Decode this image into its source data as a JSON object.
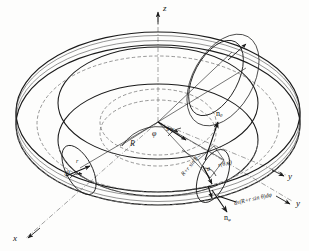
{
  "figure": {
    "background_color": "#fdfdfc",
    "line_color": "#1a1a1a",
    "dashed_color": "#555555"
  },
  "axes": [
    {
      "name": "z-axis",
      "label": "z",
      "x": 163,
      "y": 4,
      "kind": "axis"
    },
    {
      "name": "y-axis",
      "label": "y",
      "x": 296,
      "y": 204,
      "kind": "axis"
    },
    {
      "name": "x-axis",
      "label": "x",
      "x": 13,
      "y": 238,
      "kind": "axis"
    },
    {
      "name": "y-hat-axis",
      "label": "y",
      "x": 288,
      "y": 176,
      "kind": "unit-vector",
      "hat": true
    }
  ],
  "symbols": [
    {
      "name": "major-radius-R",
      "label": "R",
      "x": 130,
      "y": 140,
      "class": "sym-lbl"
    },
    {
      "name": "angle-phi",
      "label": "φ",
      "x": 152,
      "y": 132,
      "class": "sym-lbl"
    },
    {
      "name": "s-hat-vector",
      "label": "s",
      "x": 165,
      "y": 116,
      "class": "sym-lbl",
      "hat": true
    },
    {
      "name": "angle-phi-arc-2",
      "label": "φ",
      "x": 168,
      "y": 127,
      "class": "tiny-lbl"
    },
    {
      "name": "minor-radius-r",
      "label": "r",
      "x": 76,
      "y": 160,
      "class": "tiny-lbl"
    },
    {
      "name": "d-theta",
      "label": "dθ",
      "x": 66,
      "y": 172,
      "class": "tiny-lbl"
    },
    {
      "name": "angle-theta-right",
      "label": "θ",
      "x": 213,
      "y": 168,
      "class": "tiny-lbl"
    }
  ],
  "vectors": [
    {
      "name": "n-theta-upper",
      "base": "n",
      "sub": "θ",
      "x": 222,
      "y": 112
    },
    {
      "name": "n-phi-lower",
      "base": "n",
      "sub": "φ",
      "x": 229,
      "y": 216
    }
  ],
  "expressions": [
    {
      "name": "surface-element-label",
      "text": "ds(R+r sin θ)dφ",
      "x": 238,
      "y": 205,
      "rotate": -14
    },
    {
      "name": "radial-distance-label",
      "text": "R+r sin θ",
      "x": 188,
      "y": 176,
      "rotate": -50
    },
    {
      "name": "r-theta-phi-label",
      "text": "r(θ,φ)",
      "x": 222,
      "y": 166,
      "rotate": -14
    }
  ]
}
